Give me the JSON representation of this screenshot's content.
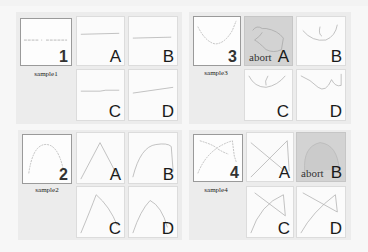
{
  "groups": [
    {
      "sample": {
        "number": "1",
        "caption": "sample1"
      },
      "options": [
        {
          "label": "A",
          "abort": false
        },
        {
          "label": "B",
          "abort": false
        },
        {
          "label": "C",
          "abort": false
        },
        {
          "label": "D",
          "abort": false
        }
      ]
    },
    {
      "sample": {
        "number": "3",
        "caption": "sample3"
      },
      "options": [
        {
          "label": "A",
          "abort": true,
          "abort_text": "abort"
        },
        {
          "label": "B",
          "abort": false
        },
        {
          "label": "C",
          "abort": false
        },
        {
          "label": "D",
          "abort": false
        }
      ]
    },
    {
      "sample": {
        "number": "2",
        "caption": "sample2"
      },
      "options": [
        {
          "label": "A",
          "abort": false
        },
        {
          "label": "B",
          "abort": false
        },
        {
          "label": "C",
          "abort": false
        },
        {
          "label": "D",
          "abort": false
        }
      ]
    },
    {
      "sample": {
        "number": "4",
        "caption": "sample4"
      },
      "options": [
        {
          "label": "A",
          "abort": false
        },
        {
          "label": "B",
          "abort": true,
          "abort_text": "abort"
        },
        {
          "label": "C",
          "abort": false
        },
        {
          "label": "D",
          "abort": false
        }
      ]
    }
  ],
  "colors": {
    "stroke": "#b8b8b8",
    "abort_bg": "#d3d3d3",
    "group_bg": "#ececec"
  }
}
